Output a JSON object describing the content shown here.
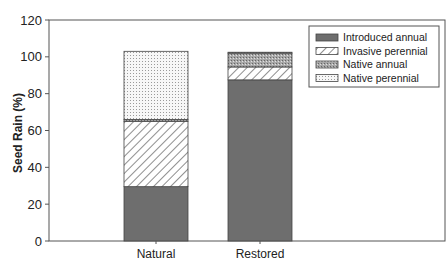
{
  "chart_data": {
    "type": "bar",
    "stacked": true,
    "title": "",
    "xlabel": "",
    "ylabel": "Seed Rain (%)",
    "ylim": [
      0,
      120
    ],
    "yticks": [
      0,
      20,
      40,
      60,
      80,
      100,
      120
    ],
    "grid": false,
    "legend_position": "upper right (inside)",
    "categories": [
      "Natural",
      "Restored"
    ],
    "series": [
      {
        "name": "Introduced annual",
        "pattern": "solid-dark-gray",
        "color": "#6e6e6e",
        "values": [
          29.5,
          87.5
        ]
      },
      {
        "name": "Invasive perennial",
        "pattern": "diagonal-hatch",
        "color": "#ffffff",
        "values": [
          35.5,
          7
        ]
      },
      {
        "name": "Native annual",
        "pattern": "crosshatch-gray",
        "color": "#9a9a9a",
        "values": [
          1,
          7.5
        ]
      },
      {
        "name": "Native perennial",
        "pattern": "fine-dots",
        "color": "#f4f4f4",
        "values": [
          37,
          0.5
        ]
      }
    ]
  }
}
